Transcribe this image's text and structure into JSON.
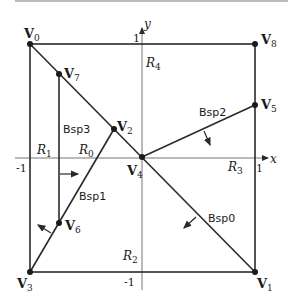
{
  "colors": {
    "line": "#2a2a2a",
    "axis": "#777777",
    "background": "#ffffff"
  },
  "axes": {
    "x_label": "x",
    "y_label": "y",
    "x_ticks": [
      "-1",
      "1"
    ],
    "y_ticks": [
      "1",
      "-1"
    ]
  },
  "vertices": [
    {
      "name": "V",
      "sub": "0"
    },
    {
      "name": "V",
      "sub": "1"
    },
    {
      "name": "V",
      "sub": "2"
    },
    {
      "name": "V",
      "sub": "3"
    },
    {
      "name": "V",
      "sub": "4"
    },
    {
      "name": "V",
      "sub": "5"
    },
    {
      "name": "V",
      "sub": "6"
    },
    {
      "name": "V",
      "sub": "7"
    },
    {
      "name": "V",
      "sub": "8"
    }
  ],
  "regions": [
    {
      "name": "R",
      "sub": "0"
    },
    {
      "name": "R",
      "sub": "1"
    },
    {
      "name": "R",
      "sub": "2"
    },
    {
      "name": "R",
      "sub": "3"
    },
    {
      "name": "R",
      "sub": "4"
    }
  ],
  "partitions": [
    "Bsp0",
    "Bsp1",
    "Bsp2",
    "Bsp3"
  ]
}
